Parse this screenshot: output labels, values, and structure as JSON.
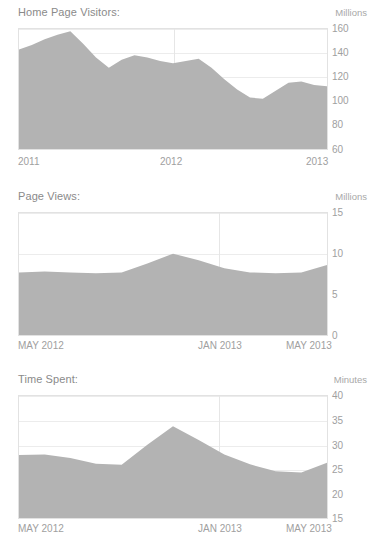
{
  "chart_data": [
    {
      "type": "area",
      "title": "Home Page Visitors:",
      "unit_label": "Millions",
      "ylabel": "Millions",
      "xlabel": "",
      "ylim": [
        60,
        165
      ],
      "yticks": [
        160,
        140,
        120,
        100,
        80,
        60
      ],
      "ytick_labels": [
        "160",
        "140",
        "120",
        "100",
        "80",
        "60"
      ],
      "gridlines": true,
      "legend": "none",
      "xtick_labels": [
        "2011",
        "2012",
        "2013"
      ],
      "x": [
        0,
        1,
        2,
        3,
        4,
        5,
        6,
        7,
        8,
        9,
        10,
        11,
        12,
        13,
        14,
        15,
        16,
        17,
        18,
        19,
        20,
        21,
        22,
        23,
        24
      ],
      "values": [
        147,
        151,
        156,
        160,
        163,
        152,
        140,
        131,
        138,
        142,
        140,
        137,
        135,
        137,
        139,
        131,
        121,
        112,
        105,
        104,
        111,
        118,
        119,
        116,
        115
      ]
    },
    {
      "type": "area",
      "title": "Page Views:",
      "unit_label": "Millions",
      "ylabel": "Millions",
      "xlabel": "",
      "ylim": [
        0,
        15
      ],
      "yticks": [
        15,
        10,
        5,
        0
      ],
      "ytick_labels": [
        "15",
        "10",
        "5",
        "0"
      ],
      "gridlines": true,
      "legend": "none",
      "xtick_labels": [
        "MAY 2012",
        "JAN 2013",
        "MAY 2013"
      ],
      "x": [
        0,
        1,
        2,
        3,
        4,
        5,
        6,
        7,
        8,
        9,
        10,
        11,
        12
      ],
      "values": [
        7.7,
        7.8,
        7.7,
        7.6,
        7.7,
        8.8,
        10.0,
        9.2,
        8.2,
        7.7,
        7.6,
        7.7,
        8.6
      ]
    },
    {
      "type": "area",
      "title": "Time Spent:",
      "unit_label": "Minutes",
      "ylabel": "Minutes",
      "xlabel": "",
      "ylim": [
        15,
        40
      ],
      "yticks": [
        40,
        35,
        30,
        25,
        20,
        15
      ],
      "ytick_labels": [
        "40",
        "35",
        "30",
        "25",
        "20",
        "15"
      ],
      "gridlines": true,
      "legend": "none",
      "xtick_labels": [
        "MAY 2012",
        "JAN 2013",
        "MAY 2013"
      ],
      "x": [
        0,
        1,
        2,
        3,
        4,
        5,
        6,
        7,
        8,
        9,
        10,
        11,
        12
      ],
      "values": [
        27.9,
        28.0,
        27.3,
        26.1,
        25.9,
        30.0,
        33.8,
        31.0,
        28.0,
        26.0,
        24.6,
        24.3,
        26.3
      ]
    }
  ],
  "charts": [
    {
      "title": "Home Page Visitors:",
      "unit": "Millions",
      "yticks": [
        "160",
        "140",
        "120",
        "100",
        "80",
        "60"
      ],
      "xticks": [
        "2011",
        "2012",
        "2013"
      ]
    },
    {
      "title": "Page Views:",
      "unit": "Millions",
      "yticks": [
        "15",
        "10",
        "5",
        "0"
      ],
      "xticks": [
        "MAY 2012",
        "JAN 2013",
        "MAY 2013"
      ]
    },
    {
      "title": "Time Spent:",
      "unit": "Minutes",
      "yticks": [
        "40",
        "35",
        "30",
        "25",
        "20",
        "15"
      ],
      "xticks": [
        "MAY 2012",
        "JAN 2013",
        "MAY 2013"
      ]
    }
  ],
  "style": {
    "area_fill": "#b3b3b3",
    "grid_color": "#ececec",
    "border_color": "#e2e2e2",
    "text_color": "#8a8a8a",
    "tick_color": "#a0a0a0",
    "background": "#ffffff"
  }
}
